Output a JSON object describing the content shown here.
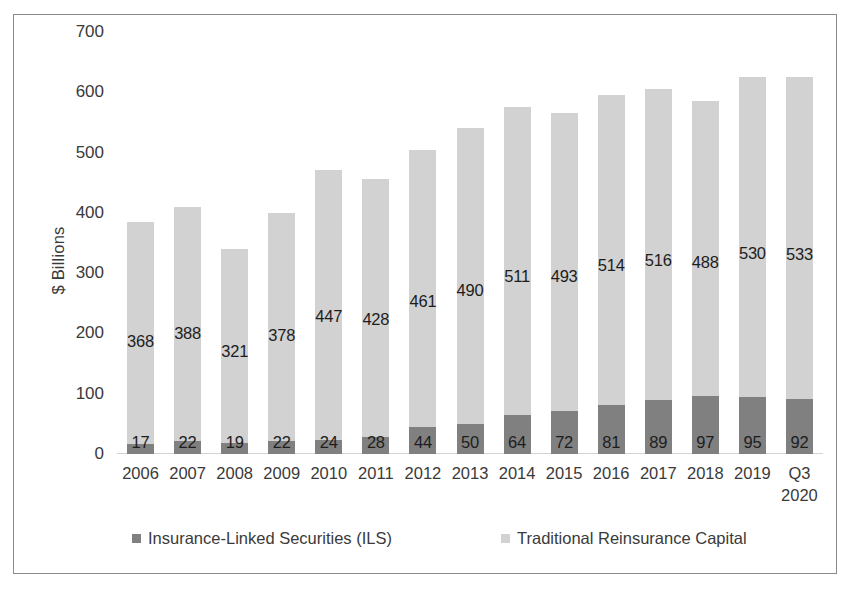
{
  "chart_data": {
    "type": "bar",
    "subtype": "stacked-bar",
    "title": "",
    "subtitle": "",
    "xlabel": "",
    "ylabel": "$ Billions",
    "ylim": [
      0,
      700
    ],
    "ytick_step": 100,
    "yticks": [
      "0",
      "100",
      "200",
      "300",
      "400",
      "500",
      "600",
      "700"
    ],
    "grid": false,
    "legend_position": "bottom",
    "categories": [
      "2006",
      "2007",
      "2008",
      "2009",
      "2010",
      "2011",
      "2012",
      "2013",
      "2014",
      "2015",
      "2016",
      "2017",
      "2018",
      "2019",
      "Q3\n2020"
    ],
    "series": [
      {
        "name": "Insurance-Linked Securities (ILS)",
        "color": "#808080",
        "values": [
          17,
          22,
          19,
          22,
          24,
          28,
          44,
          50,
          64,
          72,
          81,
          89,
          97,
          95,
          92
        ]
      },
      {
        "name": "Traditional Reinsurance Capital",
        "color": "#d2d2d2",
        "values": [
          368,
          388,
          321,
          378,
          447,
          428,
          461,
          490,
          511,
          493,
          514,
          516,
          488,
          530,
          533
        ]
      }
    ],
    "totals": [
      385,
      410,
      340,
      400,
      471,
      456,
      505,
      540,
      575,
      565,
      595,
      605,
      585,
      625,
      625
    ]
  },
  "legend": {
    "items": [
      {
        "label": "Insurance-Linked Securities (ILS)",
        "color": "#808080"
      },
      {
        "label": "Traditional Reinsurance Capital",
        "color": "#d2d2d2"
      }
    ]
  },
  "colors": {
    "ils": "#808080",
    "traditional": "#d2d2d2",
    "frame": "#8b8b8b",
    "text": "#3a3a3a",
    "background": "#ffffff"
  }
}
